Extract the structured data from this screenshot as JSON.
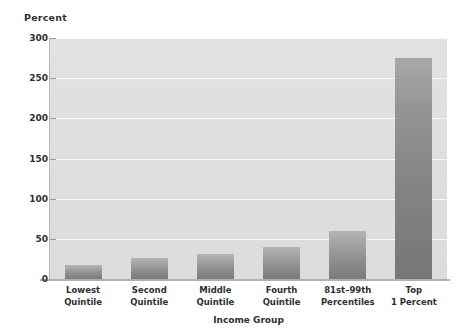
{
  "chart_data": {
    "type": "bar",
    "title": "",
    "xlabel": "Income Group",
    "ylabel": "Percent",
    "categories": [
      "Lowest Quintile",
      "Second Quintile",
      "Middle Quintile",
      "Fourth Quintile",
      "81st–99th Percentiles",
      "Top 1 Percent"
    ],
    "category_lines": [
      [
        "Lowest",
        "Quintile"
      ],
      [
        "Second",
        "Quintile"
      ],
      [
        "Middle",
        "Quintile"
      ],
      [
        "Fourth",
        "Quintile"
      ],
      [
        "81st–99th",
        "Percentiles"
      ],
      [
        "Top",
        "1 Percent"
      ]
    ],
    "values": [
      17,
      26,
      31,
      40,
      60,
      275
    ],
    "ylim": [
      0,
      300
    ],
    "yticks": [
      0,
      50,
      100,
      150,
      200,
      250,
      300
    ],
    "ytick_labels": [
      "0",
      "50",
      "100",
      "150",
      "200",
      "250",
      "300"
    ],
    "grid": true,
    "grid_axis": "y",
    "legend": "none",
    "bar_color": "#9a9a9a",
    "plot_background": "#dedede",
    "figure_background": "#ffffff",
    "gridline_color": "#ffffff",
    "text_color": "#2f2f2f"
  }
}
